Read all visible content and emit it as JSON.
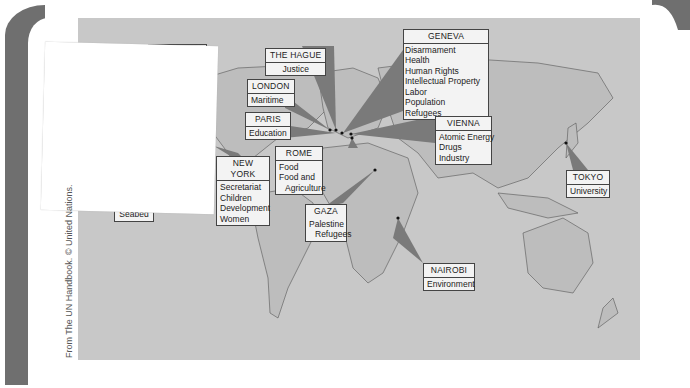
{
  "figure": {
    "type": "world-map",
    "credit": "From The UN Handbook. © United Nations.",
    "colors": {
      "map_background": "#c8c8c8",
      "land": "#bdbdbd",
      "wedge": "#7a7a7a",
      "label_box": "#f3f3f3",
      "page_tab": "#6f6f6f"
    }
  },
  "locations": [
    {
      "city": "MONTREAL",
      "topics": []
    },
    {
      "city": "THE HAGUE",
      "topics": [
        "Justice"
      ]
    },
    {
      "city": "LONDON",
      "topics": [
        "Maritime"
      ]
    },
    {
      "city": "PARIS",
      "topics": [
        "Education"
      ]
    },
    {
      "city": "GENEVA",
      "topics": [
        "Disarmament",
        "Health",
        "Human Rights",
        "Intellectual Property",
        "Labor",
        "Population",
        "Refugees"
      ]
    },
    {
      "city": "VIENNA",
      "topics": [
        "Atomic Energy",
        "Drugs",
        "Industry"
      ]
    },
    {
      "city": "NEW YORK",
      "topics": [
        "Secretariat",
        "Children",
        "Development",
        "Women"
      ]
    },
    {
      "city": "ROME",
      "topics": [
        "Food",
        "Food and",
        "Agriculture"
      ]
    },
    {
      "city": "GAZA",
      "topics": [
        "Palestine",
        "Refugees"
      ]
    },
    {
      "city": "TOKYO",
      "topics": [
        "University"
      ]
    },
    {
      "city": "NAIROBI",
      "topics": [
        "Environment"
      ]
    },
    {
      "city": "",
      "topics": [
        "Seabed"
      ]
    }
  ]
}
